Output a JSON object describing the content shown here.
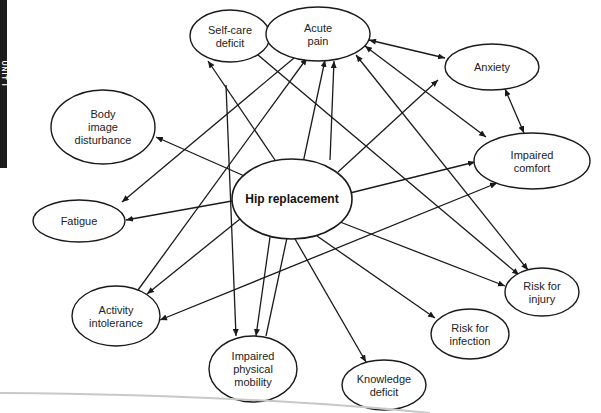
{
  "side_tab": {
    "label": "UNIT I"
  },
  "diagram": {
    "title": "Hip replacement",
    "center": {
      "id": "hip",
      "lines": [
        "Hip replacement"
      ],
      "cx": 292,
      "cy": 199,
      "rx": 60,
      "ry": 40
    },
    "nodes": [
      {
        "id": "selfcare",
        "lines": [
          "Self-care",
          "deficit"
        ],
        "cx": 230,
        "cy": 36,
        "rx": 40,
        "ry": 26
      },
      {
        "id": "pain",
        "lines": [
          "Acute",
          "pain"
        ],
        "cx": 318,
        "cy": 34,
        "rx": 52,
        "ry": 27
      },
      {
        "id": "anxiety",
        "lines": [
          "Anxiety"
        ],
        "cx": 492,
        "cy": 67,
        "rx": 47,
        "ry": 23
      },
      {
        "id": "bodyimage",
        "lines": [
          "Body",
          "image",
          "disturbance"
        ],
        "cx": 103,
        "cy": 127,
        "rx": 52,
        "ry": 37
      },
      {
        "id": "comfort",
        "lines": [
          "Impaired",
          "comfort"
        ],
        "cx": 532,
        "cy": 161,
        "rx": 58,
        "ry": 28
      },
      {
        "id": "fatigue",
        "lines": [
          "Fatigue"
        ],
        "cx": 79,
        "cy": 221,
        "rx": 46,
        "ry": 21
      },
      {
        "id": "injury",
        "lines": [
          "Risk for",
          "injury"
        ],
        "cx": 542,
        "cy": 292,
        "rx": 37,
        "ry": 24
      },
      {
        "id": "activity",
        "lines": [
          "Activity",
          "intolerance"
        ],
        "cx": 116,
        "cy": 316,
        "rx": 44,
        "ry": 30
      },
      {
        "id": "infection",
        "lines": [
          "Risk for",
          "infection"
        ],
        "cx": 470,
        "cy": 334,
        "rx": 39,
        "ry": 25
      },
      {
        "id": "mobility",
        "lines": [
          "Impaired",
          "physical",
          "mobility"
        ],
        "cx": 253,
        "cy": 369,
        "rx": 44,
        "ry": 33
      },
      {
        "id": "knowledge",
        "lines": [
          "Knowledge",
          "deficit"
        ],
        "cx": 384,
        "cy": 385,
        "rx": 42,
        "ry": 25
      }
    ],
    "edges": [
      {
        "x1": 258,
        "y1": 182,
        "x2": 156,
        "y2": 137,
        "start": false,
        "end": true
      },
      {
        "x1": 232,
        "y1": 201,
        "x2": 126,
        "y2": 220,
        "start": false,
        "end": true
      },
      {
        "x1": 275,
        "y1": 160,
        "x2": 208,
        "y2": 61,
        "start": false,
        "end": true
      },
      {
        "x1": 330,
        "y1": 160,
        "x2": 334,
        "y2": 61,
        "start": false,
        "end": true
      },
      {
        "x1": 338,
        "y1": 172,
        "x2": 438,
        "y2": 80,
        "start": false,
        "end": true
      },
      {
        "x1": 350,
        "y1": 193,
        "x2": 475,
        "y2": 162,
        "start": false,
        "end": true
      },
      {
        "x1": 340,
        "y1": 222,
        "x2": 505,
        "y2": 286,
        "start": false,
        "end": true
      },
      {
        "x1": 317,
        "y1": 236,
        "x2": 435,
        "y2": 318,
        "start": false,
        "end": true
      },
      {
        "x1": 295,
        "y1": 239,
        "x2": 366,
        "y2": 362,
        "start": false,
        "end": true
      },
      {
        "x1": 270,
        "y1": 237,
        "x2": 256,
        "y2": 336,
        "start": false,
        "end": true
      },
      {
        "x1": 240,
        "y1": 219,
        "x2": 147,
        "y2": 294,
        "start": false,
        "end": true
      },
      {
        "x1": 270,
        "y1": 34,
        "x2": 266,
        "y2": 34,
        "start": true,
        "end": true
      },
      {
        "x1": 369,
        "y1": 40,
        "x2": 445,
        "y2": 58,
        "start": true,
        "end": true
      },
      {
        "x1": 505,
        "y1": 89,
        "x2": 524,
        "y2": 133,
        "start": true,
        "end": true
      },
      {
        "x1": 294,
        "y1": 58,
        "x2": 122,
        "y2": 202,
        "start": false,
        "end": true
      },
      {
        "x1": 138,
        "y1": 290,
        "x2": 307,
        "y2": 58,
        "start": false,
        "end": true
      },
      {
        "x1": 236,
        "y1": 336,
        "x2": 226,
        "y2": 85,
        "start": true,
        "end": false
      },
      {
        "x1": 266,
        "y1": 336,
        "x2": 325,
        "y2": 60,
        "start": false,
        "end": true
      },
      {
        "x1": 365,
        "y1": 46,
        "x2": 486,
        "y2": 137,
        "start": true,
        "end": true
      },
      {
        "x1": 356,
        "y1": 55,
        "x2": 528,
        "y2": 270,
        "start": true,
        "end": true
      },
      {
        "x1": 252,
        "y1": 50,
        "x2": 519,
        "y2": 275,
        "start": true,
        "end": true
      },
      {
        "x1": 160,
        "y1": 320,
        "x2": 497,
        "y2": 183,
        "start": true,
        "end": true
      }
    ]
  },
  "colors": {
    "ink": "#1a1a1a",
    "side_tab": "#1c1c1c",
    "background": "#ffffff",
    "fold_line": "#c8c8c8"
  }
}
